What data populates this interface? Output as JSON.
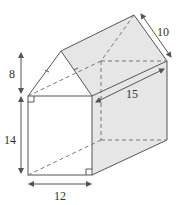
{
  "diagram": {
    "type": "pentagonal prism (house shape)",
    "labels": {
      "roof_height": "8",
      "wall_height": "14",
      "width": "12",
      "length": "15",
      "roof_slope": "10"
    },
    "colors": {
      "line": "#555555",
      "shade": "#e6e6e6",
      "background": "#ffffff"
    }
  }
}
